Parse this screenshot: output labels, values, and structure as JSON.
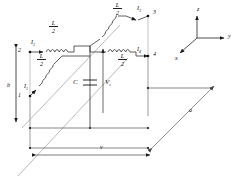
{
  "figure": {
    "type": "circuit-schematic-3d"
  },
  "nodes": [
    {
      "id": "n1",
      "label": "1",
      "x": 21,
      "y": 96
    },
    {
      "id": "n2",
      "label": "2",
      "x": 23,
      "y": 51
    },
    {
      "id": "n3",
      "label": "3",
      "x": 154,
      "y": 14
    },
    {
      "id": "n4",
      "label": "4",
      "x": 156,
      "y": 56
    }
  ],
  "currents": [
    {
      "id": "I1",
      "symbol": "I",
      "sub": "1",
      "x": 25,
      "y": 87
    },
    {
      "id": "I2",
      "symbol": "I",
      "sub": "2",
      "x": 32,
      "y": 42
    },
    {
      "id": "I3",
      "symbol": "I",
      "sub": "3",
      "x": 139,
      "y": 9
    },
    {
      "id": "I4",
      "symbol": "I",
      "sub": "4",
      "x": 139,
      "y": 50
    }
  ],
  "inductors": [
    {
      "id": "L-top-left",
      "num": "L",
      "den": "2",
      "x": 54,
      "y": 27
    },
    {
      "id": "L-bot-left",
      "num": "L",
      "den": "2",
      "x": 42,
      "y": 60
    },
    {
      "id": "L-top-right",
      "num": "L",
      "den": "2",
      "x": 118,
      "y": 9
    },
    {
      "id": "L-bot-right",
      "num": "L",
      "den": "2",
      "x": 123,
      "y": 60
    }
  ],
  "capacitor": {
    "label": "C",
    "x": 74,
    "y": 82
  },
  "voltage": {
    "symbol": "V",
    "sub": "c",
    "x": 105,
    "y": 82
  },
  "dimensions": [
    {
      "id": "dim-b",
      "label": "b",
      "x": 7,
      "y": 85
    },
    {
      "id": "dim-a",
      "label": "a",
      "x": 191,
      "y": 110
    },
    {
      "id": "dim-v",
      "label": "v",
      "x": 101,
      "y": 147
    }
  ],
  "axes": {
    "origin_label": "",
    "items": [
      {
        "id": "axis-z",
        "label": "z",
        "x": 199,
        "y": 9
      },
      {
        "id": "axis-y",
        "label": "y",
        "x": 231,
        "y": 36
      },
      {
        "id": "axis-x",
        "label": "x",
        "x": 176,
        "y": 60
      }
    ]
  },
  "colors": {
    "wire": "#555555",
    "wire_dark": "#222222",
    "component": "#111111",
    "guide": "#999999"
  }
}
